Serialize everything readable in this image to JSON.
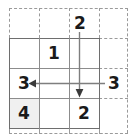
{
  "puzzle": {
    "title": "Grid Puzzle",
    "grid": {
      "rows": 3,
      "cols": 3,
      "cell_size": 30,
      "origin": {
        "x": 9,
        "y": 38
      },
      "line_color": "#8c8c8c",
      "edge_color": "#6e6e6e"
    },
    "outer_lattice": {
      "rows": 4,
      "cols": 4,
      "cell_size": 30,
      "origin": {
        "x": 9,
        "y": 8
      },
      "style": "dashed",
      "color": "#9a9a9a"
    },
    "shaded_cells": [
      {
        "row": 3,
        "col": 1,
        "color": "#f0f0f0"
      }
    ],
    "inside_numbers": [
      {
        "row": 1,
        "col": 2,
        "value": "1"
      },
      {
        "row": 2,
        "col": 1,
        "value": "3"
      },
      {
        "row": 3,
        "col": 1,
        "value": "4"
      },
      {
        "row": 3,
        "col": 3,
        "value": "2"
      }
    ],
    "outside_numbers": [
      {
        "position": "top",
        "col": 3,
        "value": "2"
      },
      {
        "position": "right",
        "row": 2,
        "value": "3"
      }
    ],
    "arrows": [
      {
        "name": "down-arrow-col3",
        "direction": "down",
        "from": {
          "x": 79,
          "y": 32
        },
        "to": {
          "x": 79,
          "y": 97
        },
        "color": "#7a7a7a"
      },
      {
        "name": "left-arrow-row2",
        "direction": "left",
        "from": {
          "x": 105,
          "y": 83
        },
        "to": {
          "x": 29,
          "y": 83
        },
        "color": "#7a7a7a"
      }
    ],
    "labels": {
      "num_1": "1",
      "num_2_top": "2",
      "num_3_left": "3",
      "num_3_right": "3",
      "num_4": "4",
      "num_2_bottom": "2"
    }
  }
}
